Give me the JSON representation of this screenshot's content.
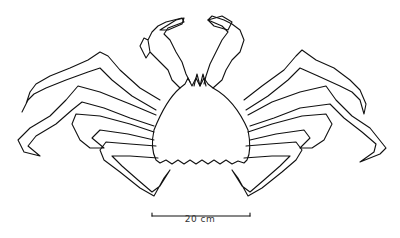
{
  "figure": {
    "scale_bar": {
      "label": "20 cm",
      "x1": 152,
      "x2": 250,
      "y": 216
    },
    "colors": {
      "stroke": "#111111",
      "background": "#ffffff"
    }
  }
}
